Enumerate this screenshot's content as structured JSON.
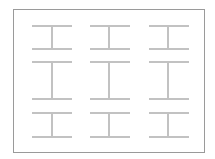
{
  "diagram": {
    "colors": {
      "background": "#ffffff",
      "frame": "#9a9a9a",
      "beam": "#c2c2c2"
    },
    "frame": {
      "x": 13,
      "y": 9,
      "width": 191,
      "height": 143
    },
    "stroke_width": 2,
    "columns": [
      {
        "x1": 32,
        "x2": 72,
        "web_x": 52
      },
      {
        "x1": 90,
        "x2": 130,
        "web_x": 109
      },
      {
        "x1": 149,
        "x2": 189,
        "web_x": 168
      }
    ],
    "rows": [
      {
        "top": 26,
        "bottom": 49
      },
      {
        "top": 62,
        "bottom": 99
      },
      {
        "top": 113,
        "bottom": 137
      }
    ]
  }
}
